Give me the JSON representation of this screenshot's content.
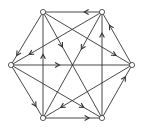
{
  "diagram": {
    "type": "directed-graph",
    "layout": "hexagon",
    "colors": {
      "edge": "#333333",
      "node_fill": "#ffffff",
      "node_stroke": "#333333",
      "background": "#ffffff"
    },
    "nodes": [
      {
        "id": "A",
        "x": 43,
        "y": 12
      },
      {
        "id": "B",
        "x": 102,
        "y": 12
      },
      {
        "id": "C",
        "x": 132,
        "y": 65
      },
      {
        "id": "D",
        "x": 102,
        "y": 118
      },
      {
        "id": "E",
        "x": 43,
        "y": 118
      },
      {
        "id": "F",
        "x": 11,
        "y": 65
      }
    ],
    "edges": [
      {
        "from": "B",
        "to": "A",
        "t": 0.3
      },
      {
        "from": "E",
        "to": "A",
        "t": 0.6
      },
      {
        "from": "A",
        "to": "D",
        "t": 0.33
      },
      {
        "from": "A",
        "to": "C",
        "t": 0.82
      },
      {
        "from": "A",
        "to": "F",
        "t": 0.82
      },
      {
        "from": "B",
        "to": "F",
        "t": 0.8
      },
      {
        "from": "B",
        "to": "E",
        "t": 0.35
      },
      {
        "from": "C",
        "to": "B",
        "t": 0.75
      },
      {
        "from": "D",
        "to": "B",
        "t": 0.8
      },
      {
        "from": "F",
        "to": "C",
        "t": 0.4
      },
      {
        "from": "F",
        "to": "E",
        "t": 0.78
      },
      {
        "from": "F",
        "to": "D",
        "t": 0.8
      },
      {
        "from": "C",
        "to": "E",
        "t": 0.8
      },
      {
        "from": "E",
        "to": "D",
        "t": 0.78
      },
      {
        "from": "D",
        "to": "C",
        "t": 0.78
      }
    ]
  }
}
